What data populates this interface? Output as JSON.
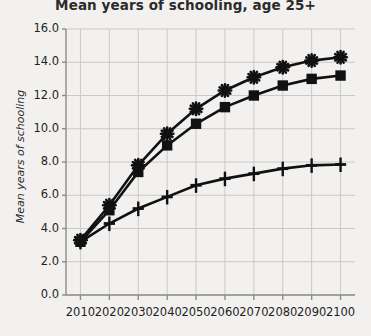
{
  "chart_data": {
    "type": "line",
    "title": "Mean years of schooling, age 25+",
    "xlabel": "",
    "ylabel": "Mean years of schooling",
    "x": [
      2010,
      2020,
      2030,
      2040,
      2050,
      2060,
      2070,
      2080,
      2090,
      2100
    ],
    "xtick_labels": [
      "2010",
      "2020",
      "2030",
      "2040",
      "2050",
      "2060",
      "2070",
      "2080",
      "2090",
      "2100"
    ],
    "ytick_labels": [
      "0.0",
      "2.0",
      "4.0",
      "6.0",
      "8.0",
      "10.0",
      "12.0",
      "14.0",
      "16.0"
    ],
    "ytick_values": [
      0.0,
      2.0,
      4.0,
      6.0,
      8.0,
      10.0,
      12.0,
      14.0,
      16.0
    ],
    "xlim": [
      2005,
      2105
    ],
    "ylim": [
      0,
      16
    ],
    "grid": true,
    "legend": "none",
    "series": [
      {
        "name": "upper-star-series",
        "marker": "star",
        "color": "#111111",
        "values": [
          3.3,
          5.4,
          7.8,
          9.7,
          11.2,
          12.3,
          13.1,
          13.7,
          14.1,
          14.3
        ]
      },
      {
        "name": "middle-square-series",
        "marker": "square",
        "color": "#111111",
        "values": [
          3.2,
          5.1,
          7.4,
          9.0,
          10.3,
          11.3,
          12.0,
          12.6,
          13.0,
          13.2
        ]
      },
      {
        "name": "lower-plus-series",
        "marker": "plus",
        "color": "#111111",
        "values": [
          3.2,
          4.3,
          5.2,
          5.9,
          6.6,
          7.0,
          7.3,
          7.6,
          7.8,
          7.85
        ]
      }
    ]
  },
  "plot_geometry": {
    "left": 66,
    "right": 355,
    "top": 29,
    "bottom": 295
  },
  "colors": {
    "background": "#f2f1ef",
    "axis": "#8c8c8c",
    "grid": "#c9c9c9",
    "ink": "#111111",
    "text": "#1f1f1f"
  }
}
